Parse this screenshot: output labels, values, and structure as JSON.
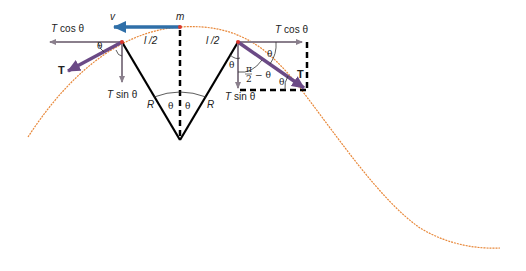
{
  "diagram": {
    "colors": {
      "curve": "#e8883a",
      "velocity": "#2f6fa8",
      "tension": "#6b4a86",
      "components": "#8a7f8c",
      "radius": "#000000",
      "point": "#d9362b"
    },
    "labels": {
      "mass": "m",
      "velocity": "v",
      "half_length_left": "l /2",
      "half_length_right": "l /2",
      "radius_left": "R",
      "radius_right": "R",
      "left_tcos": "T cos θ",
      "left_tsin": "T sin θ",
      "left_tension": "T",
      "right_tcos": "T cos θ",
      "right_tsin": "T sin θ",
      "right_tension": "T",
      "theta": "θ",
      "pi_over_2": "π",
      "two": "2",
      "minus_theta": "− θ"
    },
    "parts": {
      "T_cos_symbol": "T",
      "cos_text": "cos θ",
      "T_sin_symbol": "T",
      "sin_text": "sin θ"
    }
  }
}
